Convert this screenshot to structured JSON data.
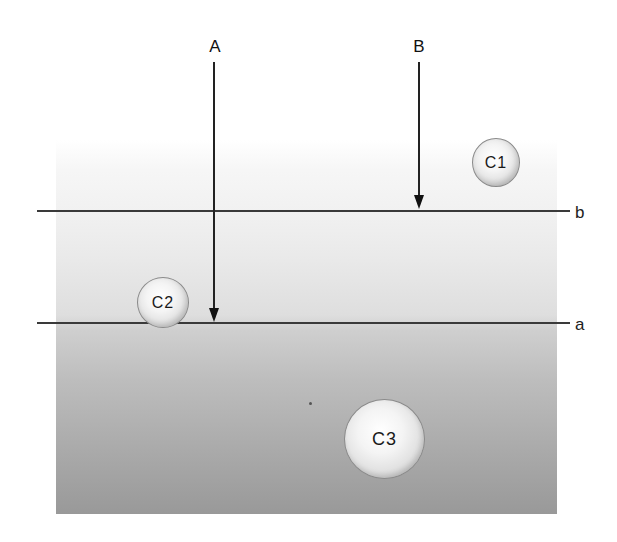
{
  "diagram": {
    "rays": [
      {
        "id": "A",
        "label": "A",
        "x": 214,
        "label_y": 40,
        "start_y": 62,
        "end_y": 321
      },
      {
        "id": "B",
        "label": "B",
        "x": 419,
        "label_y": 40,
        "start_y": 62,
        "end_y": 209
      }
    ],
    "interfaces": [
      {
        "id": "b",
        "label": "b",
        "y": 211,
        "x_start": 37,
        "x_end": 570
      },
      {
        "id": "a",
        "label": "a",
        "y": 323,
        "x_start": 37,
        "x_end": 570
      }
    ],
    "particles": [
      {
        "id": "C1",
        "label": "C1",
        "cx": 496,
        "cy": 163,
        "w": 48,
        "h": 49
      },
      {
        "id": "C2",
        "label": "C2",
        "cx": 163,
        "cy": 302,
        "w": 52,
        "h": 51
      },
      {
        "id": "C3",
        "label": "C3",
        "cx": 384,
        "cy": 439,
        "w": 81,
        "h": 80
      }
    ],
    "medium": {
      "gradient_top_color": "#ffffff",
      "gradient_bottom_color": "#999999",
      "line_color": "#3a3a3a"
    }
  }
}
